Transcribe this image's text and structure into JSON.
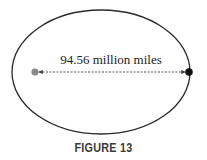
{
  "diagram": {
    "type": "ellipse-orbit",
    "distance_label": "94.56 million miles",
    "foci": [
      {
        "name": "focus-point",
        "color": "#8a8a8a"
      },
      {
        "name": "orbit-vertex-point",
        "color": "#111111"
      }
    ],
    "colors": {
      "ellipse": "#2a2a2a",
      "arrow": "#444444"
    }
  },
  "caption": "FIGURE 13"
}
